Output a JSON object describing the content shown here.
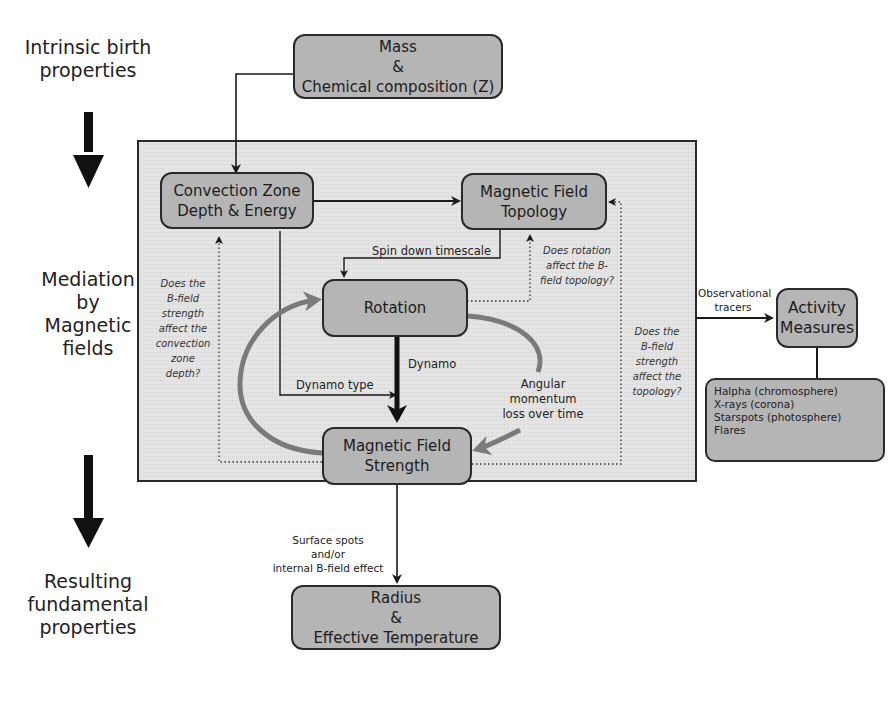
{
  "side_labels": {
    "top": [
      "Intrinsic birth",
      "properties"
    ],
    "middle": [
      "Mediation",
      "by",
      "Magnetic",
      "fields"
    ],
    "bottom": [
      "Resulting",
      "fundamental",
      "properties"
    ]
  },
  "boxes": {
    "mass": [
      "Mass",
      "&",
      "Chemical composition (Z)"
    ],
    "convection": [
      "Convection Zone",
      "Depth & Energy"
    ],
    "topology": [
      "Magnetic Field",
      "Topology"
    ],
    "rotation": [
      "Rotation"
    ],
    "strength": [
      "Magnetic Field",
      "Strength"
    ],
    "activity": [
      "Activity",
      "Measures"
    ],
    "radius": [
      "Radius",
      "&",
      "Effective Temperature"
    ]
  },
  "tracers": [
    "Halpha (chromosphere)",
    "X-rays (corona)",
    "Starspots (photosphere)",
    "Flares"
  ],
  "edge_labels": {
    "spin_down": "Spin down timescale",
    "dynamo": "Dynamo",
    "dynamo_type": "Dynamo type",
    "angular": [
      "Angular",
      "momentum",
      "loss over time"
    ],
    "observational": [
      "Observational",
      "tracers"
    ],
    "surface": [
      "Surface spots",
      "and/or",
      "internal B-field effect"
    ]
  },
  "questions": {
    "rotation_topology": [
      "Does rotation",
      "affect the B-",
      "field topology?"
    ],
    "strength_convection": [
      "Does the",
      "B-field",
      "strength",
      "affect the",
      "convection",
      "zone",
      "depth?"
    ],
    "strength_topology": [
      "Does the",
      "B-field",
      "strength",
      "affect the",
      "topology?"
    ]
  },
  "colors": {
    "box_fill": "#b5b5b5",
    "panel_fill": "#e3e3e3",
    "stroke": "#2a2a2a",
    "loop_arrow": "#7a7a7a"
  }
}
